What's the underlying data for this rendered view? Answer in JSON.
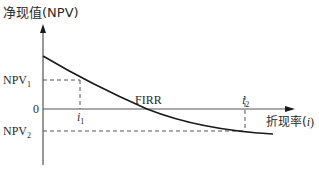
{
  "diagram": {
    "type": "npv-vs-discount-rate",
    "y_axis": {
      "label": "净现值(NPV)"
    },
    "x_axis": {
      "label_prefix": "折现率(",
      "label_var": "i",
      "label_suffix": ")"
    },
    "zero_label": "0",
    "npv1": {
      "base": "NPV",
      "sub": "1"
    },
    "npv2": {
      "base": "NPV",
      "sub": "2"
    },
    "i1": {
      "base": "i",
      "sub": "1"
    },
    "i2": {
      "base": "i",
      "sub": "2"
    },
    "firr_label": "FIRR",
    "colors": {
      "line": "#1a1a1a",
      "axis": "#333333",
      "dashed": "#555555",
      "text": "#2a2a2a"
    }
  }
}
